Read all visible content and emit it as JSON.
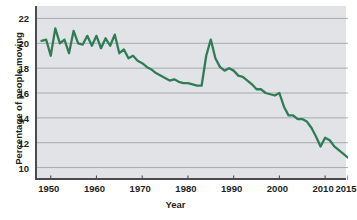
{
  "chart_data": {
    "type": "line",
    "title": "",
    "xlabel": "Year",
    "ylabel": "Percentage of people moving",
    "xlim": [
      1947,
      2015
    ],
    "ylim": [
      9,
      23
    ],
    "grid": "horizontal",
    "legend": "none",
    "line_color": "#2e7d55",
    "plot_background": "#e2e3e7",
    "axis_color": "#4c4c50",
    "gridline_color": "#9a9aa0",
    "xticks": [
      1950,
      1960,
      1970,
      1980,
      1990,
      2000,
      2010,
      2015
    ],
    "xtick_labels": [
      "1950",
      "1960",
      "1970",
      "1980",
      "1990",
      "2000",
      "2010",
      "2015"
    ],
    "yticks": [
      10,
      12,
      14,
      16,
      18,
      20,
      22
    ],
    "ytick_labels": [
      "10",
      "12",
      "14",
      "16",
      "18",
      "20",
      "22"
    ],
    "series": [
      {
        "name": "Percentage of people moving",
        "x": [
          1948,
          1949,
          1950,
          1951,
          1952,
          1953,
          1954,
          1955,
          1956,
          1957,
          1958,
          1959,
          1960,
          1961,
          1962,
          1963,
          1964,
          1965,
          1966,
          1967,
          1968,
          1969,
          1970,
          1971,
          1972,
          1973,
          1974,
          1975,
          1976,
          1977,
          1978,
          1979,
          1980,
          1981,
          1982,
          1983,
          1984,
          1985,
          1986,
          1987,
          1988,
          1989,
          1990,
          1991,
          1992,
          1993,
          1994,
          1995,
          1996,
          1997,
          1998,
          1999,
          2000,
          2001,
          2002,
          2003,
          2004,
          2005,
          2006,
          2007,
          2008,
          2009,
          2010,
          2011,
          2012,
          2013,
          2014,
          2015
        ],
        "values": [
          20.2,
          20.3,
          19.0,
          21.2,
          20.0,
          20.3,
          19.2,
          21.0,
          20.0,
          19.9,
          20.6,
          19.8,
          20.6,
          19.6,
          20.4,
          19.8,
          20.7,
          19.2,
          19.5,
          18.8,
          19.0,
          18.6,
          18.4,
          18.1,
          17.9,
          17.6,
          17.4,
          17.2,
          17.0,
          17.1,
          16.9,
          16.8,
          16.8,
          16.7,
          16.6,
          16.6,
          19.0,
          20.3,
          18.8,
          18.1,
          17.8,
          18.0,
          17.8,
          17.4,
          17.3,
          17.0,
          16.7,
          16.3,
          16.3,
          16.0,
          15.9,
          15.8,
          16.0,
          14.9,
          14.2,
          14.2,
          13.9,
          13.9,
          13.7,
          13.2,
          12.5,
          11.7,
          12.4,
          12.2,
          11.7,
          11.4,
          11.1,
          10.8
        ]
      }
    ]
  },
  "axis_text": {
    "x_title": "Year",
    "y_title": "Percentage of people moving"
  }
}
